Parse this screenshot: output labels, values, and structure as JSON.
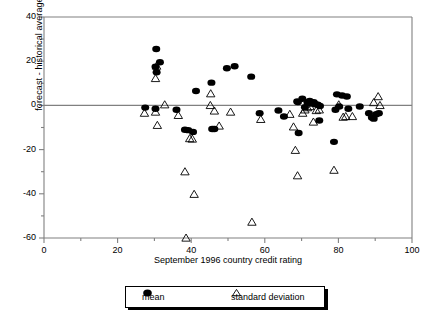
{
  "chart_data": {
    "type": "scatter",
    "title": "",
    "xlabel": "September  1996 country credit rating",
    "ylabel": "forecast - historical average",
    "xlim": [
      0,
      100
    ],
    "ylim": [
      -60,
      40
    ],
    "xticks": [
      0,
      20,
      40,
      60,
      80,
      100
    ],
    "xtick_labels": [
      "0",
      "20",
      "40",
      "60",
      "80",
      "100"
    ],
    "xminor_ticks": [
      10,
      30,
      50,
      70,
      90
    ],
    "yticks": [
      40,
      20,
      0,
      -20,
      -40,
      -60
    ],
    "ytick_labels": [
      "40",
      "20",
      "0",
      "-20",
      "-40",
      "-60"
    ],
    "yminor_ticks": [
      30,
      10,
      -10,
      -30,
      -50
    ],
    "grid": false,
    "zero_line": true,
    "legend_position": "below",
    "series": [
      {
        "name": "mean",
        "marker": "filled-circle",
        "color": "#000000",
        "points": [
          [
            27.5,
            -1.0
          ],
          [
            30.5,
            25.5
          ],
          [
            30.3,
            17.5
          ],
          [
            30.6,
            15.0
          ],
          [
            31.5,
            19.5
          ],
          [
            30.3,
            -1.5
          ],
          [
            36.0,
            -2.0
          ],
          [
            38.3,
            -11.0
          ],
          [
            39.2,
            -11.2
          ],
          [
            40.5,
            -12.0
          ],
          [
            41.3,
            6.5
          ],
          [
            45.5,
            10.3
          ],
          [
            45.7,
            -10.7
          ],
          [
            46.3,
            -10.7
          ],
          [
            49.7,
            16.8
          ],
          [
            51.8,
            17.7
          ],
          [
            56.3,
            13.0
          ],
          [
            58.6,
            -3.5
          ],
          [
            63.7,
            -2.3
          ],
          [
            65.2,
            -5.0
          ],
          [
            68.8,
            1.8
          ],
          [
            69.2,
            -12.5
          ],
          [
            69.0,
            1.5
          ],
          [
            70.2,
            3.0
          ],
          [
            70.9,
            -0.8
          ],
          [
            71.6,
            1.3
          ],
          [
            72.2,
            2.0
          ],
          [
            72.6,
            0.8
          ],
          [
            73.3,
            1.5
          ],
          [
            73.8,
            0.5
          ],
          [
            74.4,
            0.3
          ],
          [
            74.8,
            -6.8
          ],
          [
            75.0,
            -0.3
          ],
          [
            78.8,
            -16.5
          ],
          [
            79.2,
            -2.0
          ],
          [
            79.6,
            5.0
          ],
          [
            80.2,
            -0.5
          ],
          [
            81.0,
            4.5
          ],
          [
            82.3,
            4.0
          ],
          [
            82.7,
            -1.5
          ],
          [
            85.8,
            -0.5
          ],
          [
            88.3,
            -3.5
          ],
          [
            89.1,
            -5.5
          ],
          [
            89.6,
            -6.0
          ],
          [
            90.3,
            -4.0
          ],
          [
            91.0,
            -3.5
          ]
        ]
      },
      {
        "name": "standard deviation",
        "marker": "open-triangle",
        "color": "#000000",
        "points": [
          [
            27.3,
            -3.5
          ],
          [
            30.3,
            12.2
          ],
          [
            30.6,
            17.8
          ],
          [
            30.3,
            -3.0
          ],
          [
            30.8,
            -9.0
          ],
          [
            32.8,
            0.3
          ],
          [
            36.5,
            -4.5
          ],
          [
            38.3,
            -30.0
          ],
          [
            38.6,
            -60.0
          ],
          [
            39.6,
            -15.0
          ],
          [
            40.3,
            -15.2
          ],
          [
            40.8,
            -40.2
          ],
          [
            45.3,
            5.3
          ],
          [
            45.2,
            0.0
          ],
          [
            46.3,
            -2.5
          ],
          [
            47.6,
            -9.3
          ],
          [
            50.7,
            -3.0
          ],
          [
            56.5,
            -52.8
          ],
          [
            58.9,
            -6.3
          ],
          [
            66.8,
            -4.0
          ],
          [
            67.8,
            -9.7
          ],
          [
            68.3,
            -20.3
          ],
          [
            68.9,
            -31.8
          ],
          [
            70.3,
            -3.5
          ],
          [
            70.9,
            -2.0
          ],
          [
            71.6,
            -1.0
          ],
          [
            72.3,
            -0.5
          ],
          [
            73.2,
            -7.5
          ],
          [
            74.0,
            -2.3
          ],
          [
            74.8,
            -2.0
          ],
          [
            78.8,
            -29.3
          ],
          [
            80.1,
            0.3
          ],
          [
            81.3,
            -5.3
          ],
          [
            82.0,
            -5.0
          ],
          [
            83.8,
            -5.0
          ],
          [
            89.6,
            1.3
          ],
          [
            90.8,
            4.0
          ],
          [
            91.3,
            0.0
          ]
        ]
      }
    ]
  },
  "legend": {
    "items": [
      {
        "label": "mean",
        "marker": "filled-circle"
      },
      {
        "label": "standard deviation",
        "marker": "open-triangle"
      }
    ]
  }
}
